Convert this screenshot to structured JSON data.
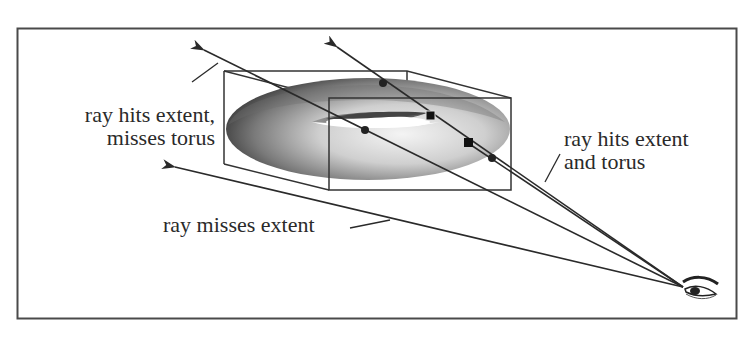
{
  "diagram": {
    "type": "ray-extent-intersection-illustration",
    "colors": {
      "line": "#2a2a2a",
      "frame": "#4a4a4a",
      "torus_dark": "#3a3a3a",
      "torus_light": "#f2f2f2",
      "background": "#ffffff"
    },
    "labels": {
      "hits_extent_misses_torus": {
        "line1": "ray hits extent,",
        "line2": "misses torus"
      },
      "hits_extent_and_torus": {
        "line1": "ray hits extent",
        "line2": "and torus"
      },
      "misses_extent": "ray misses extent"
    },
    "objects": [
      {
        "id": "torus",
        "label": "torus"
      },
      {
        "id": "extent",
        "label": "bounding box extent"
      },
      {
        "id": "eye",
        "label": "viewer eye"
      }
    ],
    "rays": [
      {
        "id": "ray-1",
        "outcome": "hits extent, misses torus"
      },
      {
        "id": "ray-2",
        "outcome": "hits extent and torus (upper)"
      },
      {
        "id": "ray-3",
        "outcome": "hits extent and torus"
      },
      {
        "id": "ray-4",
        "outcome": "misses extent"
      }
    ]
  }
}
